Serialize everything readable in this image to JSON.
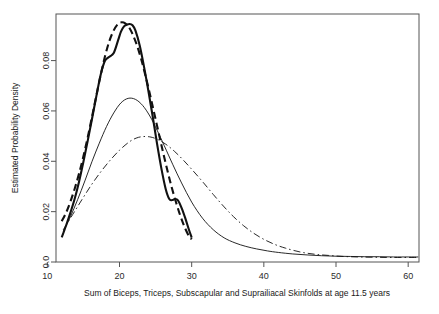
{
  "chart_data": {
    "type": "line",
    "title": "",
    "xlabel": "Sum of Biceps, Triceps, Subscapular and Suprailiacal Skinfolds at age 11.5 years",
    "ylabel": "Estimated Probability Density",
    "xlim": [
      11.2,
      61.5
    ],
    "ylim": [
      0.0,
      0.0985
    ],
    "grid": false,
    "legend": "none",
    "xticks": [
      10,
      20,
      30,
      40,
      50,
      60
    ],
    "xtick_labels": [
      "10",
      "20",
      "30",
      "40",
      "50",
      "60"
    ],
    "yticks": [
      0.0,
      0.02,
      0.04,
      0.06,
      0.08
    ],
    "ytick_labels": [
      "0.0",
      "0.02",
      "0.04",
      "0.06",
      "0.08"
    ],
    "series": [
      {
        "name": "thick-solid-kernel-density",
        "style": "solid",
        "linewidth": 2.1,
        "color": "#111111",
        "x": [
          12.0,
          12.6,
          13.2,
          13.8,
          14.4,
          15.0,
          15.6,
          16.2,
          16.8,
          17.4,
          18.0,
          18.6,
          19.2,
          19.8,
          20.2,
          20.6,
          21.0,
          21.4,
          21.8,
          22.2,
          22.8,
          23.4,
          24.0,
          24.6,
          25.2,
          25.8,
          26.4,
          26.9,
          27.3,
          27.7,
          28.1,
          28.6,
          29.1,
          29.6,
          30.0
        ],
        "y": [
          0.0098,
          0.0145,
          0.0196,
          0.0252,
          0.032,
          0.0398,
          0.0482,
          0.057,
          0.066,
          0.0745,
          0.08,
          0.0815,
          0.083,
          0.088,
          0.0915,
          0.0935,
          0.0942,
          0.0945,
          0.094,
          0.092,
          0.086,
          0.0775,
          0.068,
          0.0578,
          0.047,
          0.0372,
          0.029,
          0.025,
          0.0246,
          0.025,
          0.0245,
          0.0215,
          0.0175,
          0.013,
          0.0097
        ]
      },
      {
        "name": "thick-dashed-parametric-fit",
        "style": "dashed",
        "linewidth": 2.1,
        "color": "#111111",
        "dasharray": "7,4",
        "x": [
          12.0,
          12.6,
          13.2,
          13.8,
          14.4,
          15.0,
          15.6,
          16.2,
          16.8,
          17.4,
          18.0,
          18.6,
          19.2,
          19.8,
          20.3,
          20.8,
          21.3,
          21.8,
          22.4,
          23.0,
          23.6,
          24.2,
          24.8,
          25.4,
          26.0,
          26.6,
          27.2,
          27.8,
          28.4,
          29.0,
          29.6,
          30.0
        ],
        "y": [
          0.0162,
          0.0196,
          0.024,
          0.0292,
          0.0352,
          0.042,
          0.0496,
          0.0578,
          0.0662,
          0.0744,
          0.0818,
          0.0878,
          0.092,
          0.0946,
          0.0952,
          0.0948,
          0.0933,
          0.0906,
          0.0862,
          0.0806,
          0.074,
          0.0668,
          0.0592,
          0.0516,
          0.044,
          0.0368,
          0.03,
          0.024,
          0.0186,
          0.014,
          0.0104,
          0.009
        ]
      },
      {
        "name": "thin-solid-density",
        "style": "solid",
        "linewidth": 0.9,
        "color": "#111111",
        "x": [
          12.2,
          13.2,
          14.2,
          15.2,
          16.2,
          17.2,
          18.2,
          19.2,
          20.2,
          21.2,
          22.2,
          23.2,
          24.2,
          25.2,
          26.2,
          27.4,
          28.6,
          30.0,
          31.5,
          33.0,
          34.5,
          36.0,
          37.5,
          39.0,
          40.5,
          42.0,
          44.0,
          46.0,
          48.0,
          50.0,
          52.0,
          54.0,
          56.0,
          58.0,
          60.0,
          61.4
        ],
        "y": [
          0.0122,
          0.018,
          0.0248,
          0.0322,
          0.04,
          0.0472,
          0.0538,
          0.0592,
          0.0632,
          0.065,
          0.0646,
          0.0622,
          0.058,
          0.0524,
          0.0462,
          0.0386,
          0.0314,
          0.0238,
          0.0174,
          0.0128,
          0.0096,
          0.0076,
          0.0062,
          0.0052,
          0.0044,
          0.0038,
          0.0032,
          0.0028,
          0.0025,
          0.0023,
          0.0022,
          0.0021,
          0.0021,
          0.002,
          0.002,
          0.002
        ]
      },
      {
        "name": "thin-dashdot-density",
        "style": "dashdot",
        "linewidth": 0.9,
        "color": "#111111",
        "dasharray": "7,3,1.5,3",
        "x": [
          12.2,
          13.5,
          14.8,
          16.1,
          17.4,
          18.7,
          20.0,
          21.3,
          22.3,
          23.2,
          24.2,
          25.2,
          26.4,
          27.6,
          28.8,
          30.2,
          31.6,
          33.0,
          34.4,
          35.8,
          37.2,
          38.6,
          40.0,
          41.5,
          43.0,
          45.0,
          47.0,
          49.0,
          51.0,
          53.0,
          55.0,
          57.0,
          59.0,
          61.4
        ],
        "y": [
          0.0128,
          0.0188,
          0.0248,
          0.0306,
          0.0358,
          0.0404,
          0.0444,
          0.0476,
          0.0492,
          0.0498,
          0.0497,
          0.0488,
          0.0468,
          0.044,
          0.0406,
          0.0362,
          0.0316,
          0.0268,
          0.0222,
          0.018,
          0.0144,
          0.0114,
          0.009,
          0.007,
          0.0055,
          0.004,
          0.0031,
          0.0026,
          0.0022,
          0.002,
          0.0019,
          0.0018,
          0.0018,
          0.0018
        ]
      }
    ]
  },
  "axes": {
    "x_title": "Sum of Biceps, Triceps, Subscapular and Suprailiacal Skinfolds at age 11.5 years",
    "y_title": "Estimated Probability Density"
  },
  "ticks": {
    "x": [
      {
        "label": "10",
        "value": 10
      },
      {
        "label": "20",
        "value": 20
      },
      {
        "label": "30",
        "value": 30
      },
      {
        "label": "40",
        "value": 40
      },
      {
        "label": "50",
        "value": 50
      },
      {
        "label": "60",
        "value": 60
      }
    ],
    "y": [
      {
        "label": "0.0",
        "value": 0.0
      },
      {
        "label": "0.02",
        "value": 0.02
      },
      {
        "label": "0.04",
        "value": 0.04
      },
      {
        "label": "0.06",
        "value": 0.06
      },
      {
        "label": "0.08",
        "value": 0.08
      }
    ]
  },
  "colors": {
    "curve": "#111111",
    "frame": "#555555",
    "background": "#ffffff",
    "text": "#1a1a1a"
  }
}
